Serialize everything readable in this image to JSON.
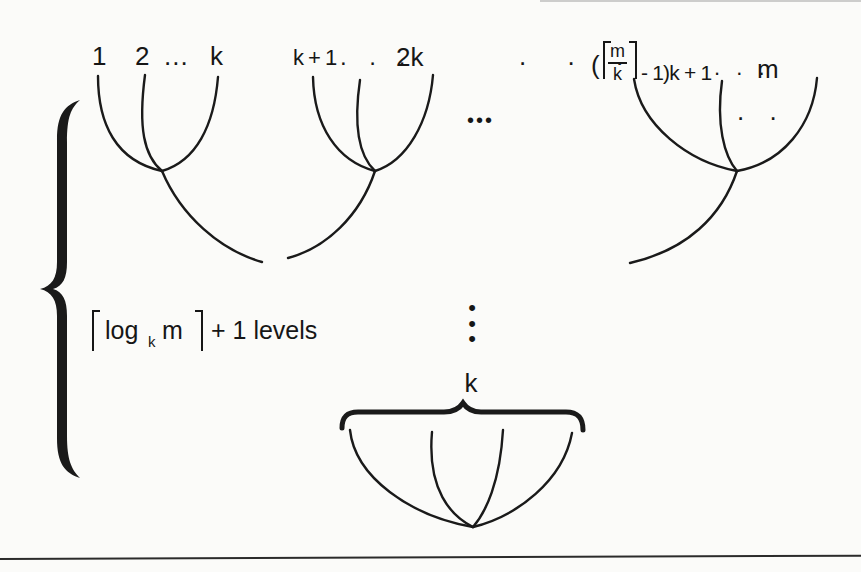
{
  "colors": {
    "ink": "#1a1a1a",
    "paper": "#fbfbf9"
  },
  "level_annotation": {
    "lceil": "⌈",
    "func": "log",
    "subscript": "k",
    "argument": "m",
    "rceil": "⌉",
    "suffix": "+ 1 levels"
  },
  "top_row": {
    "tree1_leaves": [
      "1",
      "2",
      "...",
      "k"
    ],
    "tree2_leaves": {
      "first": "k + 1",
      "dots": ". . .",
      "last": "2k"
    },
    "between_trees_dots": ". . .",
    "between_trees_bold_dots": "•••",
    "tree3_leaves": {
      "open": "(",
      "lceil": "⌈",
      "frac_num": "m",
      "frac_den": "k",
      "rceil": "⌉",
      "after": "- 1)k + 1",
      "dots": ". . .",
      "last": "m",
      "inner_dots": ". ."
    }
  },
  "middle": {
    "vertical_dots": [
      "•",
      "•",
      "•"
    ]
  },
  "bottom_tree": {
    "fanin_label": "k"
  }
}
